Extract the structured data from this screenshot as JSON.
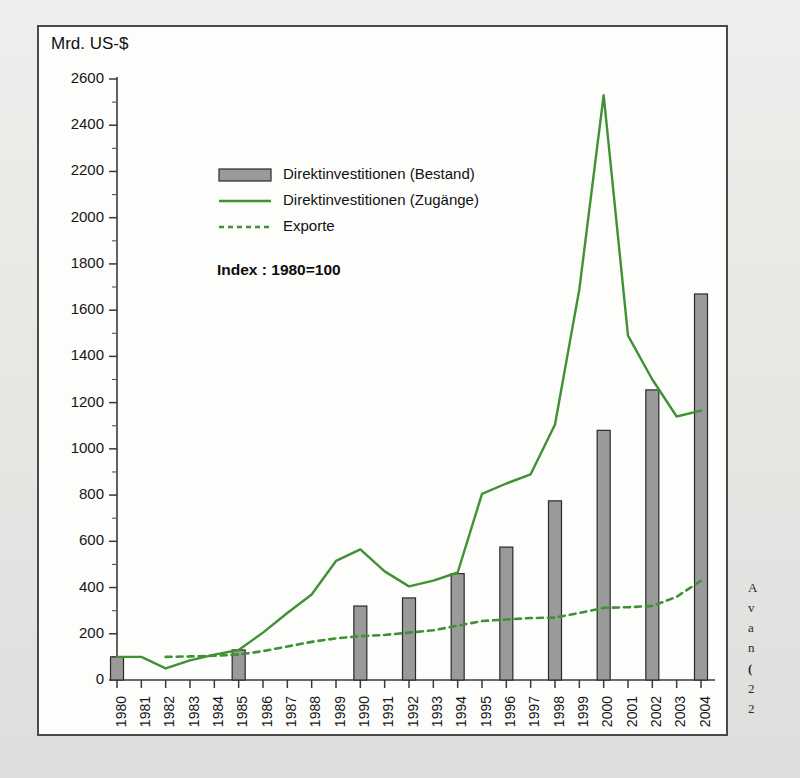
{
  "figure": {
    "y_axis_title": "Mrd. US-$",
    "index_note": "Index : 1980=100",
    "frame_border_color": "#4a4a4a",
    "plot_background": "#fdfdfc",
    "page_background": "#e9e9e7"
  },
  "legend": {
    "items": [
      {
        "label": "Direktinvestitionen (Bestand)",
        "marker": "bar-swatch",
        "color": "#9a9a9a"
      },
      {
        "label": "Direktinvestitionen (Zugänge)",
        "marker": "solid-line",
        "color": "#3f9134"
      },
      {
        "label": "Exporte",
        "marker": "dashed-line",
        "color": "#3f9134"
      }
    ]
  },
  "margin_note": {
    "lines": [
      "A",
      "v",
      "a",
      "n",
      "(",
      "2",
      "2"
    ]
  },
  "chart_data": {
    "type": "bar",
    "title": "",
    "subtitle": "",
    "xlabel": "",
    "ylabel": "Mrd. US-$",
    "ylim": [
      0,
      2600
    ],
    "ytick_step": 200,
    "yminor_step": 100,
    "grid": false,
    "legend_position": "inside-upper-left",
    "annotation": "Index : 1980=100",
    "categories": [
      "1980",
      "1981",
      "1982",
      "1983",
      "1984",
      "1985",
      "1986",
      "1987",
      "1988",
      "1989",
      "1990",
      "1991",
      "1992",
      "1993",
      "1994",
      "1995",
      "1996",
      "1997",
      "1998",
      "1999",
      "2000",
      "2001",
      "2002",
      "2003",
      "2004"
    ],
    "ytick_labels": [
      "0",
      "200",
      "400",
      "600",
      "800",
      "1000",
      "1200",
      "1400",
      "1600",
      "1800",
      "2000",
      "2200",
      "2400",
      "2600"
    ],
    "series": [
      {
        "name": "Direktinvestitionen (Bestand)",
        "type": "bar",
        "color": "#9a9a9a",
        "x": [
          "1980",
          "1985",
          "1990",
          "1992",
          "1994",
          "1996",
          "1998",
          "2000",
          "2002",
          "2004"
        ],
        "values": [
          100,
          130,
          320,
          355,
          460,
          575,
          775,
          1080,
          1255,
          1670
        ]
      },
      {
        "name": "Direktinvestitionen (Zugänge)",
        "type": "line",
        "style": "solid",
        "color": "#3f9134",
        "x": [
          "1980",
          "1981",
          "1982",
          "1983",
          "1984",
          "1985",
          "1986",
          "1987",
          "1988",
          "1989",
          "1990",
          "1991",
          "1992",
          "1993",
          "1994",
          "1995",
          "1996",
          "1997",
          "1998",
          "1999",
          "2000",
          "2001",
          "2002",
          "2003",
          "2004"
        ],
        "values": [
          100,
          100,
          50,
          85,
          110,
          130,
          205,
          290,
          370,
          515,
          565,
          470,
          405,
          430,
          465,
          805,
          850,
          890,
          1105,
          1690,
          2530,
          1490,
          1300,
          1140,
          1165
        ]
      },
      {
        "name": "Exporte",
        "type": "line",
        "style": "dashed",
        "color": "#3f9134",
        "x": [
          "1982",
          "1983",
          "1984",
          "1985",
          "1986",
          "1987",
          "1988",
          "1989",
          "1990",
          "1991",
          "1992",
          "1993",
          "1994",
          "1995",
          "1996",
          "1997",
          "1998",
          "1999",
          "2000",
          "2001",
          "2002",
          "2003",
          "2004"
        ],
        "values": [
          100,
          102,
          105,
          110,
          125,
          145,
          165,
          180,
          190,
          195,
          205,
          215,
          235,
          255,
          262,
          268,
          270,
          290,
          312,
          315,
          320,
          360,
          430
        ]
      }
    ]
  }
}
